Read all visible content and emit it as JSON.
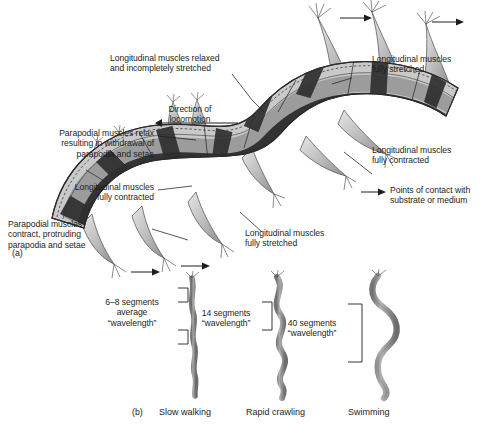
{
  "figure": {
    "title_visible": false,
    "background_color": "#ffffff",
    "panels": [
      {
        "id": "a",
        "label": "(a)",
        "subject": "polychaete-body-wall-muscles-and-parapodia"
      },
      {
        "id": "b",
        "label": "(b)",
        "subject": "body-waveforms-during-three-locomotion-modes"
      }
    ]
  },
  "panel_a": {
    "panel_label": "(a)",
    "callouts": [
      {
        "name": "longitudinal-muscles-relaxed",
        "text": "Longitudinal muscles relaxed\nand incompletely stretched"
      },
      {
        "name": "direction-of-locomotion",
        "text": "Direction of\nlocomotion"
      },
      {
        "name": "parapodial-muscles-relax",
        "text": "Parapodial muscles relax\nresulting in withdrawal of\nparapodia and setae"
      },
      {
        "name": "longitudinal-muscles-fully-contracted-left",
        "text": "Longitudinal muscles\nfully contracted"
      },
      {
        "name": "parapodial-muscles-contract",
        "text": "Parapodial muscles\ncontract, protruding\nparapodia and setae"
      },
      {
        "name": "longitudinal-muscles-fully-stretched-bottom",
        "text": "Longitudinal muscles\nfully stretched"
      },
      {
        "name": "longitudinal-muscles-fully-stretched-top",
        "text": "Longitudinal muscles\nfully stretched"
      },
      {
        "name": "longitudinal-muscles-fully-contracted-right",
        "text": "Longitudinal muscles\nfully contracted"
      }
    ],
    "legend": {
      "name": "points-of-contact-legend",
      "text": "Points of contact with\nsubstrate or medium",
      "symbol": "arrow-right-icon"
    },
    "colors": {
      "cuticle": "#c8c8c8",
      "muscle_band_mid": "#9a9a9a",
      "muscle_band_dark": "#3a3a3a",
      "parapodia": "#b5b5b5",
      "outline": "#2b2b2b"
    }
  },
  "panel_b": {
    "panel_label": "(b)",
    "modes": [
      {
        "name": "slow-walking",
        "caption": "Slow walking",
        "bracket_label": "6–8 segments\naverage\n“wavelength”",
        "segments": "6–8",
        "amplitude": "minimal"
      },
      {
        "name": "rapid-crawling",
        "caption": "Rapid crawling",
        "bracket_label": "14 segments\n“wavelength”",
        "segments": "14",
        "amplitude": "moderate"
      },
      {
        "name": "swimming",
        "caption": "Swimming",
        "bracket_label": "40 segments\n“wavelength”",
        "segments": "40",
        "amplitude": "large"
      }
    ],
    "colors": {
      "worm_body": "#9c9c9c",
      "worm_outline": "#4a4a4a",
      "bracket": "#2b2b2b"
    }
  }
}
